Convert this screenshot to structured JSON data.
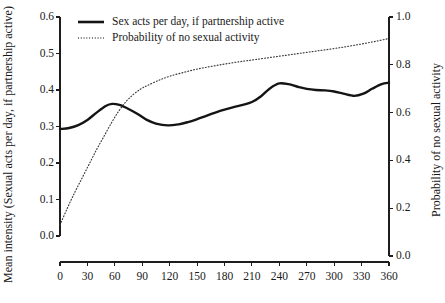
{
  "chart_data": {
    "type": "line",
    "title": "",
    "xlabel": "",
    "ylabel": "Mean intensity (Sexual acts per day, if partnership active)",
    "y2label": "Probability of no sexual activity",
    "xlim": [
      0,
      360
    ],
    "ylim": [
      0.0,
      0.6
    ],
    "y2lim": [
      0.0,
      1.0
    ],
    "grid": false,
    "legend_position": "top-center",
    "xticks": [
      "0",
      "30",
      "60",
      "90",
      "120",
      "150",
      "180",
      "210",
      "240",
      "270",
      "300",
      "330",
      "360"
    ],
    "xtick_values": [
      0,
      30,
      60,
      90,
      120,
      150,
      180,
      210,
      240,
      270,
      300,
      330,
      360
    ],
    "yticks": [
      "0.0",
      "0.1",
      "0.2",
      "0.3",
      "0.4",
      "0.5",
      "0.6"
    ],
    "ytick_values": [
      0.0,
      0.1,
      0.2,
      0.3,
      0.4,
      0.5,
      0.6
    ],
    "y2ticks": [
      "0.0",
      "0.2",
      "0.4",
      "0.6",
      "0.8",
      "1.0"
    ],
    "y2tick_values": [
      0.0,
      0.2,
      0.4,
      0.6,
      0.8,
      1.0
    ],
    "series": [
      {
        "name": "Sex acts per day, if partnership active",
        "axis": "left",
        "style": "solid",
        "color": "#141414",
        "x": [
          0,
          10,
          20,
          30,
          40,
          50,
          57,
          65,
          75,
          85,
          95,
          105,
          118,
          130,
          140,
          150,
          160,
          170,
          180,
          190,
          200,
          210,
          220,
          230,
          240,
          250,
          260,
          270,
          280,
          290,
          300,
          310,
          322,
          332,
          342,
          352,
          360
        ],
        "values": [
          0.293,
          0.296,
          0.304,
          0.318,
          0.338,
          0.356,
          0.362,
          0.359,
          0.348,
          0.334,
          0.318,
          0.308,
          0.303,
          0.306,
          0.312,
          0.32,
          0.329,
          0.338,
          0.346,
          0.353,
          0.359,
          0.367,
          0.383,
          0.405,
          0.418,
          0.416,
          0.409,
          0.403,
          0.4,
          0.399,
          0.396,
          0.39,
          0.384,
          0.39,
          0.404,
          0.416,
          0.42
        ]
      },
      {
        "name": "Probability of no sexual activity",
        "axis": "right",
        "style": "dotted",
        "color": "#3a3a3a",
        "x": [
          0,
          8,
          16,
          24,
          32,
          40,
          48,
          56,
          64,
          72,
          80,
          88,
          96,
          108,
          120,
          135,
          150,
          165,
          180,
          195,
          210,
          225,
          240,
          255,
          270,
          285,
          300,
          315,
          330,
          345,
          360
        ],
        "values": [
          0.13,
          0.2,
          0.265,
          0.325,
          0.385,
          0.445,
          0.5,
          0.555,
          0.605,
          0.645,
          0.675,
          0.698,
          0.714,
          0.735,
          0.752,
          0.768,
          0.782,
          0.793,
          0.803,
          0.812,
          0.82,
          0.828,
          0.836,
          0.844,
          0.852,
          0.86,
          0.868,
          0.877,
          0.887,
          0.898,
          0.91
        ]
      }
    ]
  },
  "legend": {
    "entries": [
      {
        "label": "Sex acts per day, if partnership active",
        "style": "solid"
      },
      {
        "label": "Probability of no sexual activity",
        "style": "dotted"
      }
    ]
  },
  "axes": {
    "left_title": "Mean intensity (Sexual acts per day, if partnership active)",
    "right_title": "Probability of no sexual activity"
  }
}
